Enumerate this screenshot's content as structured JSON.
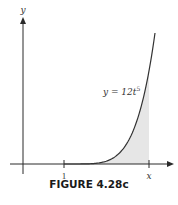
{
  "figure": {
    "caption": "FIGURE 4.28c",
    "curve_label_prefix": "y = 12t",
    "curve_label_exponent": "5",
    "axis_labels": {
      "y": "y"
    },
    "tick_labels": [
      "1",
      "x"
    ]
  },
  "colors": {
    "axis": "#2a2a2a",
    "curve": "#333333",
    "shade": "#e6e6e6"
  },
  "chart_data": {
    "type": "area",
    "title": "FIGURE 4.28c",
    "function": "y = 12t^5",
    "xlabel": "",
    "ylabel": "y",
    "x_tick_labels": [
      "1",
      "x"
    ],
    "shaded_interval": [
      "1",
      "x"
    ],
    "curve_t_range": [
      0,
      1.06
    ],
    "grid": false
  }
}
